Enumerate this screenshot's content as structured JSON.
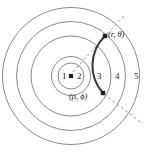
{
  "figure": {
    "background_color": "#ffffff",
    "circle_stroke_color": "#7c7c7c",
    "arc_color": "#3b3b3b",
    "dashed_color": "#8a8a8a",
    "text_color": "#231f20",
    "width": 151,
    "height": 152
  },
  "center": {
    "name": "origin-dot",
    "x": 71,
    "y": 76
  },
  "circles": [
    {
      "id": "c1",
      "radius": 13
    },
    {
      "id": "c2",
      "radius": 19.5
    },
    {
      "id": "c3",
      "radius": 40
    },
    {
      "id": "c4",
      "radius": 54.5
    },
    {
      "id": "c5",
      "radius": 68.5
    }
  ],
  "region_labels": [
    {
      "id": "r1",
      "text": "1",
      "x": 62,
      "y": 72
    },
    {
      "id": "r2",
      "text": "2",
      "x": 77,
      "y": 72
    },
    {
      "id": "r3",
      "text": "3",
      "x": 97,
      "y": 72
    },
    {
      "id": "r4",
      "text": "4",
      "x": 115,
      "y": 72
    },
    {
      "id": "r5",
      "text": "5",
      "x": 134,
      "y": 72
    }
  ],
  "points": [
    {
      "id": "p-outer",
      "label": "(r, θ)",
      "marker_x": 105,
      "marker_y": 36,
      "label_x": 108,
      "label_y": 30
    },
    {
      "id": "p-inner",
      "label": "(ρ, ϕ)",
      "marker_x": 103,
      "marker_y": 93,
      "label_x": 69,
      "label_y": 92
    }
  ],
  "arc": {
    "name": "trajectory-arc",
    "description": "thick dark arc connecting the two labeled points",
    "start_x": 105,
    "start_y": 36,
    "end_x": 103,
    "end_y": 93
  },
  "dashed_lines": [
    {
      "id": "d-theta",
      "description": "radial dashed line from origin to (r, theta)",
      "x1": 73,
      "y1": 72,
      "x2": 106,
      "y2": 35
    },
    {
      "id": "d-upper-tick",
      "description": "short dashed radial tick outside (r, theta)",
      "x1": 107,
      "y1": 34,
      "x2": 124,
      "y2": 16
    },
    {
      "id": "d-phi",
      "description": "radial dashed line from (rho, phi) outward to the rim",
      "x1": 104,
      "y1": 94,
      "x2": 143,
      "y2": 124
    }
  ]
}
